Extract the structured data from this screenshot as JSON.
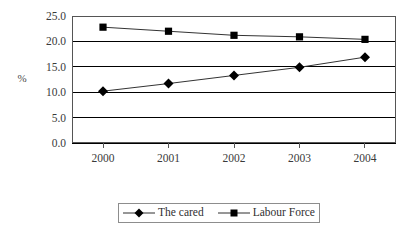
{
  "chart_data": {
    "type": "line",
    "title": "",
    "xlabel": "",
    "ylabel": "%",
    "categories": [
      "2000",
      "2001",
      "2002",
      "2003",
      "2004"
    ],
    "ylim": [
      0.0,
      25.0
    ],
    "ytick_step": 5.0,
    "ytick_labels": [
      "25.0",
      "20.0",
      "15.0",
      "10.0",
      "5.0",
      "0.0"
    ],
    "ytick_values": [
      25.0,
      20.0,
      15.0,
      10.0,
      5.0,
      0.0
    ],
    "grid": true,
    "grid_axis": "y",
    "legend_position": "bottom",
    "series": [
      {
        "name": "The cared",
        "marker": "diamond",
        "color": "#000000",
        "values": [
          10.2,
          11.7,
          13.3,
          14.9,
          16.9
        ]
      },
      {
        "name": "Labour Force",
        "marker": "square",
        "color": "#000000",
        "values": [
          22.8,
          22.0,
          21.2,
          20.9,
          20.4
        ]
      }
    ]
  },
  "axis": {
    "y_title": "%"
  },
  "legend": {
    "items": [
      {
        "label": "The cared",
        "marker": "diamond"
      },
      {
        "label": "Labour Force",
        "marker": "square"
      }
    ]
  },
  "style": {
    "frame_color": "#555555",
    "grid_color": "#000000",
    "series_line_color": "#333333",
    "marker_color": "#000000",
    "background": "#ffffff"
  }
}
